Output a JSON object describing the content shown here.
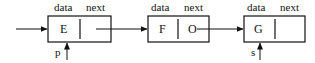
{
  "diagram": {
    "type": "singly-linked-list",
    "colors": {
      "stroke": "#111111",
      "background": "#ffffff"
    },
    "field_labels": {
      "data": "data",
      "next": "next"
    },
    "nodes": [
      {
        "id": "E",
        "data": "E",
        "next": "pointer-to-F",
        "box": {
          "x": 48,
          "y": 16,
          "w": 63,
          "h": 26,
          "divider": 80
        }
      },
      {
        "id": "F",
        "data": "F",
        "next": "O",
        "box": {
          "x": 148,
          "y": 16,
          "w": 61,
          "h": 26,
          "divider": 178
        }
      },
      {
        "id": "G",
        "data": "G",
        "next": "",
        "box": {
          "x": 244,
          "y": 16,
          "w": 61,
          "h": 26,
          "divider": 275
        }
      }
    ],
    "pointers": [
      {
        "name": "p",
        "label": "p",
        "points_to": "E"
      },
      {
        "name": "s",
        "label": "s",
        "points_to": "G"
      }
    ],
    "edges": [
      {
        "from": "incoming",
        "to": "E"
      },
      {
        "from": "E",
        "to": "F"
      },
      {
        "from": "F",
        "to": "G"
      }
    ]
  }
}
